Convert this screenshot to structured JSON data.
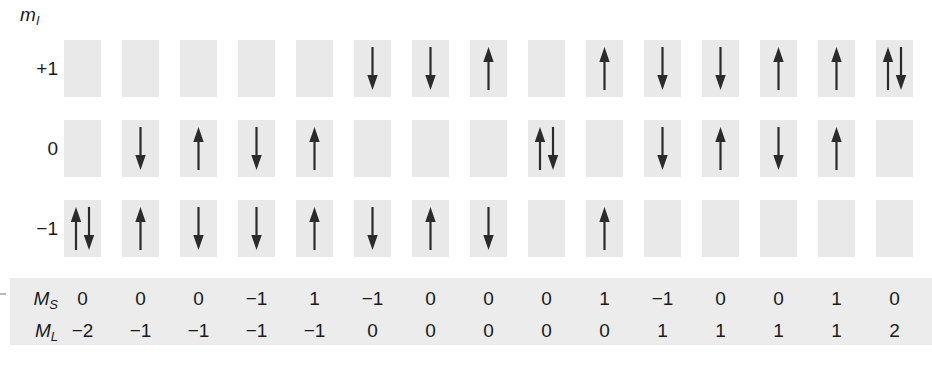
{
  "figure": {
    "axis_label": "m",
    "axis_label_sub": "l",
    "columns_count": 15,
    "colors": {
      "cell_fill": "#e9e9e9",
      "band_fill": "#ececec",
      "arrow": "#2b2b2b",
      "text": "#1a1a1a",
      "background": "#ffffff"
    },
    "orbital_rows": [
      {
        "label": "+1",
        "ml_value": 1,
        "cells": [
          "",
          "",
          "",
          "",
          "",
          "down",
          "down",
          "up",
          "",
          "up",
          "down",
          "down",
          "up",
          "up",
          "updown"
        ]
      },
      {
        "label": "0",
        "ml_value": 0,
        "cells": [
          "",
          "down",
          "up",
          "down",
          "up",
          "",
          "",
          "",
          "updown",
          "",
          "down",
          "up",
          "down",
          "up",
          ""
        ]
      },
      {
        "label": "−1",
        "ml_value": -1,
        "cells": [
          "updown",
          "up",
          "down",
          "down",
          "up",
          "down",
          "up",
          "down",
          "",
          "up",
          "",
          "",
          "",
          "",
          ""
        ]
      }
    ],
    "summary_rows": [
      {
        "label": "M",
        "label_sub": "S",
        "values": [
          "0",
          "0",
          "0",
          "−1",
          "1",
          "−1",
          "0",
          "0",
          "0",
          "1",
          "−1",
          "0",
          "0",
          "1",
          "0"
        ]
      },
      {
        "label": "M",
        "label_sub": "L",
        "values": [
          "−2",
          "−1",
          "−1",
          "−1",
          "−1",
          "0",
          "0",
          "0",
          "0",
          "0",
          "1",
          "1",
          "1",
          "1",
          "2"
        ]
      }
    ]
  }
}
